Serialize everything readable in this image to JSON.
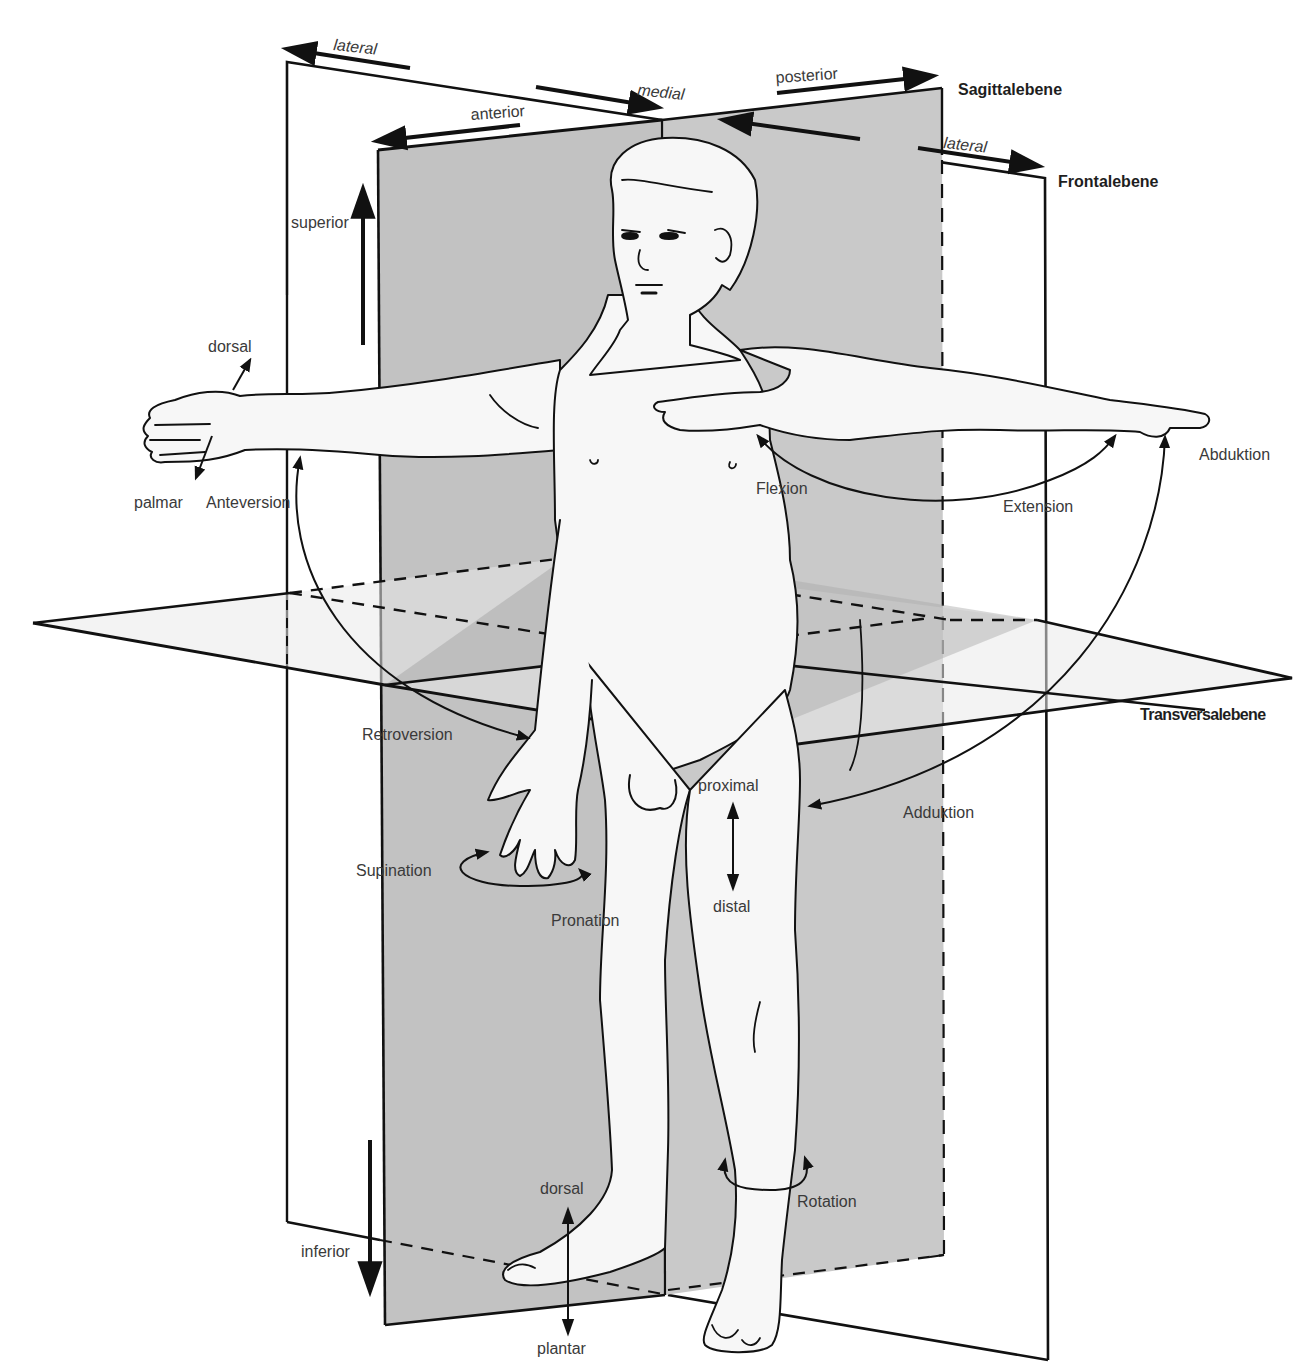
{
  "diagram": {
    "colors": {
      "plane_fill_dark": "#b9b9b9",
      "plane_fill_mid": "#cfcfcf",
      "plane_fill_light": "#e6e6e6",
      "body_fill": "#f7f7f7",
      "line": "#111111",
      "text": "#3a3a3a"
    },
    "planes": [
      {
        "id": "sagittal",
        "label": "Sagittalebene",
        "x": 958,
        "y": 95
      },
      {
        "id": "frontal",
        "label": "Frontalebene",
        "x": 1058,
        "y": 187
      },
      {
        "id": "transversal",
        "label": "Transversalebene",
        "x": 1140,
        "y": 720
      }
    ],
    "direction_labels": [
      {
        "id": "lateral-left",
        "text": "lateral",
        "x": 333,
        "y": 50,
        "italic": true,
        "rotate": 6
      },
      {
        "id": "medial",
        "text": "medial",
        "x": 637,
        "y": 95,
        "italic": true,
        "rotate": 6
      },
      {
        "id": "anterior",
        "text": "anterior",
        "x": 471,
        "y": 120,
        "italic": false,
        "rotate": -4
      },
      {
        "id": "posterior",
        "text": "posterior",
        "x": 776,
        "y": 83,
        "italic": false,
        "rotate": -4
      },
      {
        "id": "lateral-right",
        "text": "lateral",
        "x": 943,
        "y": 148,
        "italic": true,
        "rotate": 6
      },
      {
        "id": "superior",
        "text": "superior",
        "x": 291,
        "y": 228,
        "italic": false,
        "rotate": 0
      },
      {
        "id": "inferior",
        "text": "inferior",
        "x": 301,
        "y": 1257,
        "italic": false,
        "rotate": 0
      },
      {
        "id": "dorsal-hand",
        "text": "dorsal",
        "x": 208,
        "y": 352,
        "italic": false,
        "rotate": 0
      },
      {
        "id": "palmar",
        "text": "palmar",
        "x": 134,
        "y": 508,
        "italic": false,
        "rotate": 0
      },
      {
        "id": "proximal",
        "text": "proximal",
        "x": 698,
        "y": 791,
        "italic": false,
        "rotate": 0
      },
      {
        "id": "distal",
        "text": "distal",
        "x": 713,
        "y": 912,
        "italic": false,
        "rotate": 0
      },
      {
        "id": "dorsal-foot",
        "text": "dorsal",
        "x": 540,
        "y": 1194,
        "italic": false,
        "rotate": 0
      },
      {
        "id": "plantar",
        "text": "plantar",
        "x": 537,
        "y": 1354,
        "italic": false,
        "rotate": 0
      }
    ],
    "movement_labels": [
      {
        "id": "anteversion",
        "text": "Anteversion",
        "x": 206,
        "y": 508
      },
      {
        "id": "retroversion",
        "text": "Retroversion",
        "x": 362,
        "y": 740
      },
      {
        "id": "flexion",
        "text": "Flexion",
        "x": 756,
        "y": 494
      },
      {
        "id": "extension",
        "text": "Extension",
        "x": 1003,
        "y": 512
      },
      {
        "id": "abduktion",
        "text": "Abduktion",
        "x": 1199,
        "y": 460
      },
      {
        "id": "adduktion",
        "text": "Adduktion",
        "x": 903,
        "y": 818
      },
      {
        "id": "supination",
        "text": "Supination",
        "x": 356,
        "y": 876
      },
      {
        "id": "pronation",
        "text": "Pronation",
        "x": 551,
        "y": 926
      },
      {
        "id": "rotation",
        "text": "Rotation",
        "x": 797,
        "y": 1207
      }
    ]
  }
}
